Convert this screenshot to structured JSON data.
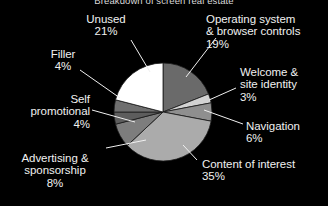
{
  "chart_data": {
    "type": "pie",
    "title": "Breakdown of screen real estate",
    "subtitle": "",
    "xlabel": "",
    "ylabel": "",
    "grid": false,
    "legend_position": "labels-with-leader-lines",
    "background_color": "#000000",
    "text_color": "#f0f0f0",
    "start_angle_deg": 0,
    "direction": "clockwise",
    "categories": [
      "Operating system & browser controls",
      "Welcome & site identity",
      "Navigation",
      "Content of interest",
      "Advertising & sponsorship",
      "Self promotional",
      "Filler",
      "Unused"
    ],
    "values": [
      19,
      3,
      6,
      35,
      8,
      4,
      4,
      21
    ],
    "value_labels": [
      "19%",
      "3%",
      "6%",
      "35%",
      "8%",
      "4%",
      "4%",
      "21%"
    ],
    "colors": [
      "#6a6a6a",
      "#d2d2d2",
      "#8f8f8f",
      "#ababab",
      "#7d7d7d",
      "#5d5d5d",
      "#6f6f6f",
      "#ffffff"
    ],
    "slices": [
      {
        "name": "Operating system & browser controls",
        "value": 19,
        "value_label": "19%",
        "color": "#6a6a6a"
      },
      {
        "name": "Welcome & site identity",
        "value": 3,
        "value_label": "3%",
        "color": "#d2d2d2"
      },
      {
        "name": "Navigation",
        "value": 6,
        "value_label": "6%",
        "color": "#8f8f8f"
      },
      {
        "name": "Content of interest",
        "value": 35,
        "value_label": "35%",
        "color": "#ababab"
      },
      {
        "name": "Advertising & sponsorship",
        "value": 8,
        "value_label": "8%",
        "color": "#7d7d7d"
      },
      {
        "name": "Self promotional",
        "value": 4,
        "value_label": "4%",
        "color": "#5d5d5d"
      },
      {
        "name": "Filler",
        "value": 4,
        "value_label": "4%",
        "color": "#6f6f6f"
      },
      {
        "name": "Unused",
        "value": 21,
        "value_label": "21%",
        "color": "#ffffff"
      }
    ]
  },
  "labels": {
    "unused": {
      "line1": "Unused",
      "line2": "",
      "pct": "21%"
    },
    "os": {
      "line1": "Operating system",
      "line2": "& browser controls",
      "pct": "19%"
    },
    "welcome": {
      "line1": "Welcome &",
      "line2": "site identity",
      "pct": "3%"
    },
    "navigation": {
      "line1": "Navigation",
      "line2": "",
      "pct": "6%"
    },
    "content": {
      "line1": "Content of interest",
      "line2": "",
      "pct": "35%"
    },
    "advertising": {
      "line1": "Advertising &",
      "line2": "sponsorship",
      "pct": "8%"
    },
    "self": {
      "line1": "Self",
      "line2": "promotional",
      "pct": "4%"
    },
    "filler": {
      "line1": "Filler",
      "line2": "",
      "pct": "4%"
    }
  }
}
